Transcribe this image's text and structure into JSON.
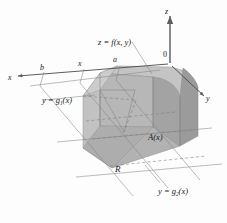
{
  "figure": {
    "name": "triple-integral-solid-diagram",
    "type": "3d-calculus-solid",
    "background_color": "#fdfdfd",
    "axes": {
      "z_label": "z",
      "y_label": "y",
      "x_label": "x",
      "origin_label": "0"
    },
    "labels": {
      "surface": "z = f(x, y)",
      "cross_section": "A(x)",
      "region": "R",
      "lower_boundary": "y = g",
      "lower_boundary_sub": "1",
      "lower_boundary_tail": "(x)",
      "upper_boundary": "y = g",
      "upper_boundary_sub": "2",
      "upper_boundary_tail": "(x)",
      "tick_a": "a",
      "tick_b": "b",
      "tick_x": "x"
    },
    "colors": {
      "solid_front": "#b9b9b9",
      "solid_side": "#a8a8a8",
      "solid_top": "#c6c6c6",
      "solid_dark": "#9a9a9a",
      "base_region": "#b4b4b4",
      "axis_line": "#6e6e6e",
      "thin_line": "#7a7a7a",
      "dashed_line": "#8a8a8a",
      "text": "#1a1a1a"
    }
  }
}
